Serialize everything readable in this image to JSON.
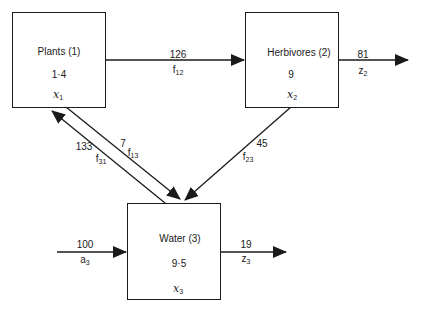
{
  "diagram": {
    "type": "compartment-flow-model",
    "compartments": [
      {
        "id": "plants",
        "name": "Plants (1)",
        "value": "1·4",
        "var": "x",
        "var_sub": "1"
      },
      {
        "id": "herbivores",
        "name": "Herbivores (2)",
        "value": "9",
        "var": "x",
        "var_sub": "2"
      },
      {
        "id": "water",
        "name": "Water (3)",
        "value": "9·5",
        "var": "x",
        "var_sub": "3"
      }
    ],
    "flows": [
      {
        "id": "f12",
        "from": "plants",
        "to": "herbivores",
        "value": "126",
        "sym": "f",
        "sub": "12"
      },
      {
        "id": "z2",
        "from": "herbivores",
        "to": "outside",
        "value": "81",
        "sym": "z",
        "sub": "2"
      },
      {
        "id": "f23",
        "from": "herbivores",
        "to": "water",
        "value": "45",
        "sym": "f",
        "sub": "23"
      },
      {
        "id": "f31",
        "from": "water",
        "to": "plants",
        "value": "133",
        "sym": "f",
        "sub": "31"
      },
      {
        "id": "f13",
        "from": "plants",
        "to": "water",
        "value": "7",
        "sym": "f",
        "sub": "13"
      },
      {
        "id": "a3",
        "from": "outside",
        "to": "water",
        "value": "100",
        "sym": "a",
        "sub": "3"
      },
      {
        "id": "z3",
        "from": "water",
        "to": "outside",
        "value": "19",
        "sym": "z",
        "sub": "3"
      }
    ]
  }
}
